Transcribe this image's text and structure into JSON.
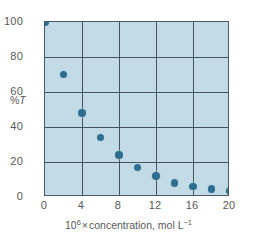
{
  "chart_data": {
    "type": "scatter",
    "title": "",
    "xlabel": "10⁶ × concentration, mol L⁻¹",
    "ylabel": "%T",
    "xlim": [
      0,
      20
    ],
    "ylim": [
      0,
      100
    ],
    "grid": true,
    "legend": null,
    "xticks": [
      "0",
      "4",
      "8",
      "12",
      "16",
      "20"
    ],
    "xtick_values": [
      0,
      4,
      8,
      12,
      16,
      20
    ],
    "yticks": [
      "0",
      "20",
      "40",
      "60",
      "80",
      "100"
    ],
    "ytick_values": [
      0,
      20,
      40,
      60,
      80,
      100
    ],
    "x": [
      0,
      2,
      4,
      6,
      8,
      10,
      12,
      14,
      16,
      18,
      20
    ],
    "y": [
      100,
      70,
      48,
      34,
      24,
      17,
      12,
      8,
      6,
      4.5,
      3.5
    ],
    "points": [
      {
        "x": 0,
        "y": 100
      },
      {
        "x": 2,
        "y": 70
      },
      {
        "x": 4,
        "y": 48
      },
      {
        "x": 6,
        "y": 34
      },
      {
        "x": 8,
        "y": 24
      },
      {
        "x": 10,
        "y": 17
      },
      {
        "x": 12,
        "y": 12
      },
      {
        "x": 14,
        "y": 8
      },
      {
        "x": 16,
        "y": 6
      },
      {
        "x": 18,
        "y": 4.5
      },
      {
        "x": 20,
        "y": 3.5
      }
    ],
    "marker_color": "#2d6e8e",
    "plot_background": "#c3dbe6",
    "grid_color": "#44545f",
    "axis_color": "#4a5a66",
    "text_color": "#58585a"
  },
  "xlabel_parts": {
    "base": "10",
    "exponent": "6",
    "times": "×",
    "quantity": "concentration, mol L",
    "unit_exponent": "−1"
  },
  "ylabel_parts": {
    "percent": "%",
    "symbol": "T"
  }
}
